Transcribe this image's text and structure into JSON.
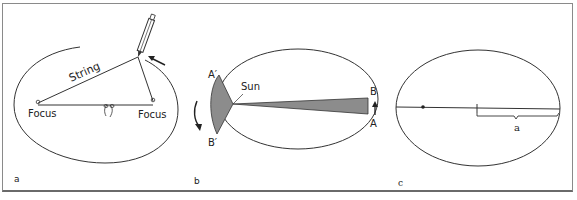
{
  "figure": {
    "panels": [
      {
        "id": "a",
        "label": "a",
        "description": "Drawing an ellipse with string and pencil around two foci",
        "texts": {
          "string": "String",
          "focus_left": "Focus",
          "focus_right": "Focus"
        }
      },
      {
        "id": "b",
        "label": "b",
        "description": "Kepler's second law: equal areas swept in equal times",
        "texts": {
          "sun": "Sun",
          "a_prime": "A′",
          "b_prime": "B′",
          "a": "A",
          "b": "B"
        }
      },
      {
        "id": "c",
        "label": "c",
        "description": "Ellipse with focus and semi-major axis a",
        "texts": {
          "semi_major": "a"
        }
      }
    ],
    "colors": {
      "line": "#333333",
      "shade": "#8c8c8c",
      "frame": "#8a8a8a"
    }
  }
}
